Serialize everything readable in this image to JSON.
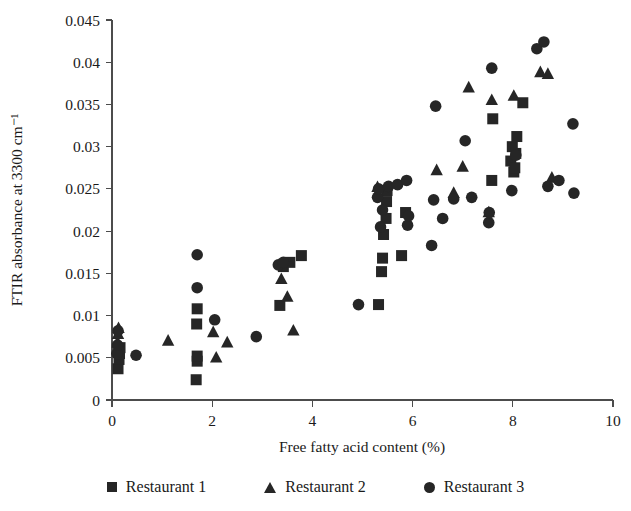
{
  "chart_data": {
    "type": "scatter",
    "title": "",
    "xlabel": "Free fatty acid content (%)",
    "ylabel": "FTIR absorbance at 3300 cm⁻¹",
    "xlim": [
      0,
      10
    ],
    "ylim": [
      0,
      0.045
    ],
    "xticks": [
      "0",
      "2",
      "4",
      "6",
      "8",
      "10"
    ],
    "xtick_values": [
      0,
      2,
      4,
      6,
      8,
      10
    ],
    "yticks": [
      "0",
      "0.005",
      "0.01",
      "0.015",
      "0.02",
      "0.025",
      "0.03",
      "0.035",
      "0.04",
      "0.045"
    ],
    "ytick_values": [
      0,
      0.005,
      0.01,
      0.015,
      0.02,
      0.025,
      0.03,
      0.035,
      0.04,
      0.045
    ],
    "grid": false,
    "legend_position": "bottom",
    "series": [
      {
        "name": "Restaurant 1",
        "marker": "square",
        "color": "#262626",
        "points": [
          [
            0.12,
            0.0037
          ],
          [
            0.14,
            0.0048
          ],
          [
            0.15,
            0.0055
          ],
          [
            0.16,
            0.0062
          ],
          [
            1.68,
            0.0024
          ],
          [
            1.7,
            0.0046
          ],
          [
            1.7,
            0.0052
          ],
          [
            1.69,
            0.009
          ],
          [
            1.7,
            0.0108
          ],
          [
            3.35,
            0.0112
          ],
          [
            3.42,
            0.0158
          ],
          [
            3.55,
            0.0163
          ],
          [
            3.78,
            0.0171
          ],
          [
            5.32,
            0.0113
          ],
          [
            5.38,
            0.0152
          ],
          [
            5.4,
            0.0168
          ],
          [
            5.42,
            0.0196
          ],
          [
            5.47,
            0.0215
          ],
          [
            5.48,
            0.0235
          ],
          [
            5.49,
            0.0248
          ],
          [
            5.78,
            0.0171
          ],
          [
            5.86,
            0.0222
          ],
          [
            7.58,
            0.026
          ],
          [
            7.6,
            0.0333
          ],
          [
            7.96,
            0.0283
          ],
          [
            7.99,
            0.03
          ],
          [
            8.02,
            0.027
          ],
          [
            8.04,
            0.0275
          ],
          [
            8.06,
            0.0292
          ],
          [
            8.08,
            0.0312
          ],
          [
            8.2,
            0.0352
          ]
        ]
      },
      {
        "name": "Restaurant 2",
        "marker": "triangle",
        "color": "#262626",
        "points": [
          [
            0.1,
            0.006
          ],
          [
            0.11,
            0.0068
          ],
          [
            0.12,
            0.0078
          ],
          [
            0.13,
            0.0085
          ],
          [
            1.12,
            0.007
          ],
          [
            2.02,
            0.008
          ],
          [
            2.08,
            0.005
          ],
          [
            2.3,
            0.0068
          ],
          [
            3.38,
            0.0143
          ],
          [
            3.5,
            0.0122
          ],
          [
            3.62,
            0.0082
          ],
          [
            5.3,
            0.0252
          ],
          [
            6.48,
            0.0272
          ],
          [
            6.82,
            0.0245
          ],
          [
            7.0,
            0.0276
          ],
          [
            7.12,
            0.037
          ],
          [
            7.52,
            0.0222
          ],
          [
            7.58,
            0.0355
          ],
          [
            8.02,
            0.036
          ],
          [
            8.55,
            0.0388
          ],
          [
            8.7,
            0.0386
          ],
          [
            8.78,
            0.0263
          ]
        ]
      },
      {
        "name": "Restaurant 3",
        "marker": "circle",
        "color": "#262626",
        "points": [
          [
            0.1,
            0.0055
          ],
          [
            0.11,
            0.0065
          ],
          [
            0.12,
            0.0082
          ],
          [
            0.48,
            0.0053
          ],
          [
            1.7,
            0.0133
          ],
          [
            1.7,
            0.0172
          ],
          [
            2.05,
            0.0095
          ],
          [
            2.88,
            0.0075
          ],
          [
            3.32,
            0.016
          ],
          [
            3.42,
            0.0163
          ],
          [
            4.92,
            0.0113
          ],
          [
            5.3,
            0.024
          ],
          [
            5.32,
            0.025
          ],
          [
            5.36,
            0.0205
          ],
          [
            5.4,
            0.0225
          ],
          [
            5.52,
            0.0253
          ],
          [
            5.7,
            0.0255
          ],
          [
            5.88,
            0.026
          ],
          [
            5.9,
            0.0207
          ],
          [
            5.92,
            0.0218
          ],
          [
            6.38,
            0.0183
          ],
          [
            6.42,
            0.0237
          ],
          [
            6.46,
            0.0348
          ],
          [
            6.6,
            0.0215
          ],
          [
            6.82,
            0.0238
          ],
          [
            7.05,
            0.0307
          ],
          [
            7.18,
            0.024
          ],
          [
            7.52,
            0.021
          ],
          [
            7.53,
            0.0222
          ],
          [
            7.58,
            0.0393
          ],
          [
            7.98,
            0.0248
          ],
          [
            8.06,
            0.029
          ],
          [
            8.48,
            0.0416
          ],
          [
            8.62,
            0.0424
          ],
          [
            8.7,
            0.0253
          ],
          [
            8.92,
            0.026
          ],
          [
            9.2,
            0.0327
          ],
          [
            9.22,
            0.0245
          ]
        ]
      }
    ]
  },
  "legend": {
    "items": [
      {
        "label": "Restaurant 1",
        "marker": "square"
      },
      {
        "label": "Restaurant 2",
        "marker": "triangle"
      },
      {
        "label": "Restaurant 3",
        "marker": "circle"
      }
    ]
  }
}
